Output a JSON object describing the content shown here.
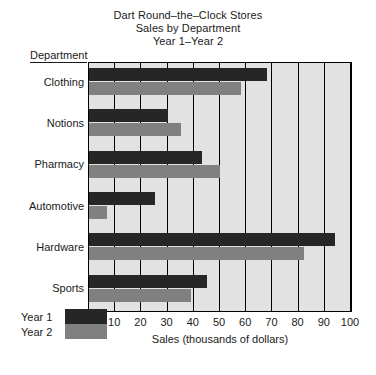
{
  "chart_data": {
    "type": "bar",
    "orientation": "horizontal",
    "title": "Dart Round–the–Clock Stores",
    "subtitle": "Sales by Department",
    "subtitle2": "Year 1–Year 2",
    "categories": [
      "Clothing",
      "Notions",
      "Pharmacy",
      "Automotive",
      "Hardware",
      "Sports"
    ],
    "category_axis_label": "Department",
    "series": [
      {
        "name": "Year 1",
        "color": "#262626",
        "values": [
          68,
          30,
          43,
          25,
          94,
          45
        ]
      },
      {
        "name": "Year 2",
        "color": "#808080",
        "values": [
          58,
          35,
          50,
          7,
          82,
          39
        ]
      }
    ],
    "xlabel": "Sales (thousands of dollars)",
    "ylabel": "Department",
    "xlim": [
      0,
      100
    ],
    "xticks": [
      10,
      20,
      30,
      40,
      50,
      60,
      70,
      80,
      90,
      100
    ],
    "xtick_labels": [
      "10",
      "20",
      "30",
      "40",
      "50",
      "60",
      "70",
      "80",
      "90",
      "100"
    ],
    "grid": "vertical",
    "plot_background": "#e2e2e2",
    "legend_position": "bottom-left",
    "legend": [
      "Year 1",
      "Year 2"
    ]
  }
}
